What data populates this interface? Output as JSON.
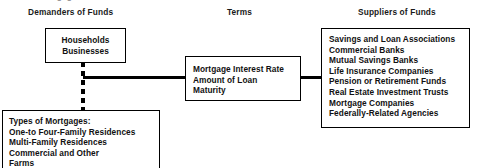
{
  "diagram": {
    "clipped_title": "The Mortgage Market",
    "headings": {
      "demanders": "Demanders of Funds",
      "terms": "Terms",
      "suppliers": "Suppliers  of Funds"
    },
    "boxes": {
      "households": {
        "name": "Households / Businesses",
        "lines": [
          "Households",
          "Businesses"
        ]
      },
      "terms": {
        "name": "Mortgage Terms",
        "lines": [
          "Mortgage Interest Rate",
          "Amount of Loan",
          "Maturity"
        ]
      },
      "suppliers": {
        "name": "Suppliers of Funds",
        "lines": [
          "Savings and Loan Associations",
          "Commercial Banks",
          "Mutual Savings Banks",
          "Life Insurance Companies",
          "Pension or Retirement Funds",
          "Real Estate Investment Trusts",
          "Mortgage Companies",
          "Federally-Related Agencies"
        ]
      },
      "types_of_mortgages": {
        "name": "Types of Mortgages",
        "lines": [
          "Types of Mortgages:",
          "One-to Four-Family Residences",
          "Multi-Family Residences",
          "Commercial and Other",
          "Farms"
        ]
      }
    },
    "connectors": {
      "dashed_trunk": "dashed-vertical-connector",
      "left_arm": "demanders-to-terms-connector",
      "right_arm": "terms-to-suppliers-connector"
    },
    "colors": {
      "line": "#000000",
      "text": "#111111",
      "background": "#ffffff"
    }
  }
}
